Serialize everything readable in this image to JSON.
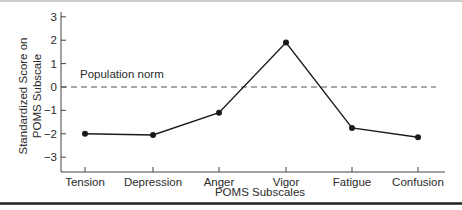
{
  "chart_data": {
    "type": "line",
    "title": "",
    "xlabel": "POMS Subscales",
    "ylabel": "Standardized Score on POMS Subscale",
    "ylabel_lines": [
      "Standardized Score on",
      "POMS Subscale"
    ],
    "categories": [
      "Tension",
      "Depression",
      "Anger",
      "Vigor",
      "Fatigue",
      "Confusion"
    ],
    "series": [
      {
        "name": "POMS profile",
        "values": [
          -2.0,
          -2.05,
          -1.1,
          1.9,
          -1.75,
          -2.15
        ]
      }
    ],
    "yticks": [
      3,
      2,
      1,
      0,
      -1,
      -2,
      -3
    ],
    "ytick_labels": [
      "3",
      "2",
      "1",
      "0",
      "−1",
      "−2",
      "−3"
    ],
    "ylim": [
      -3.6,
      3.4
    ],
    "reference_line": {
      "y": 0,
      "style": "dashed",
      "label": "Population norm"
    },
    "grid": false,
    "legend": "none",
    "colors": {
      "line": "#1a1a1a",
      "axis": "#444444",
      "reference": "#555555",
      "rule": "#222222"
    }
  }
}
